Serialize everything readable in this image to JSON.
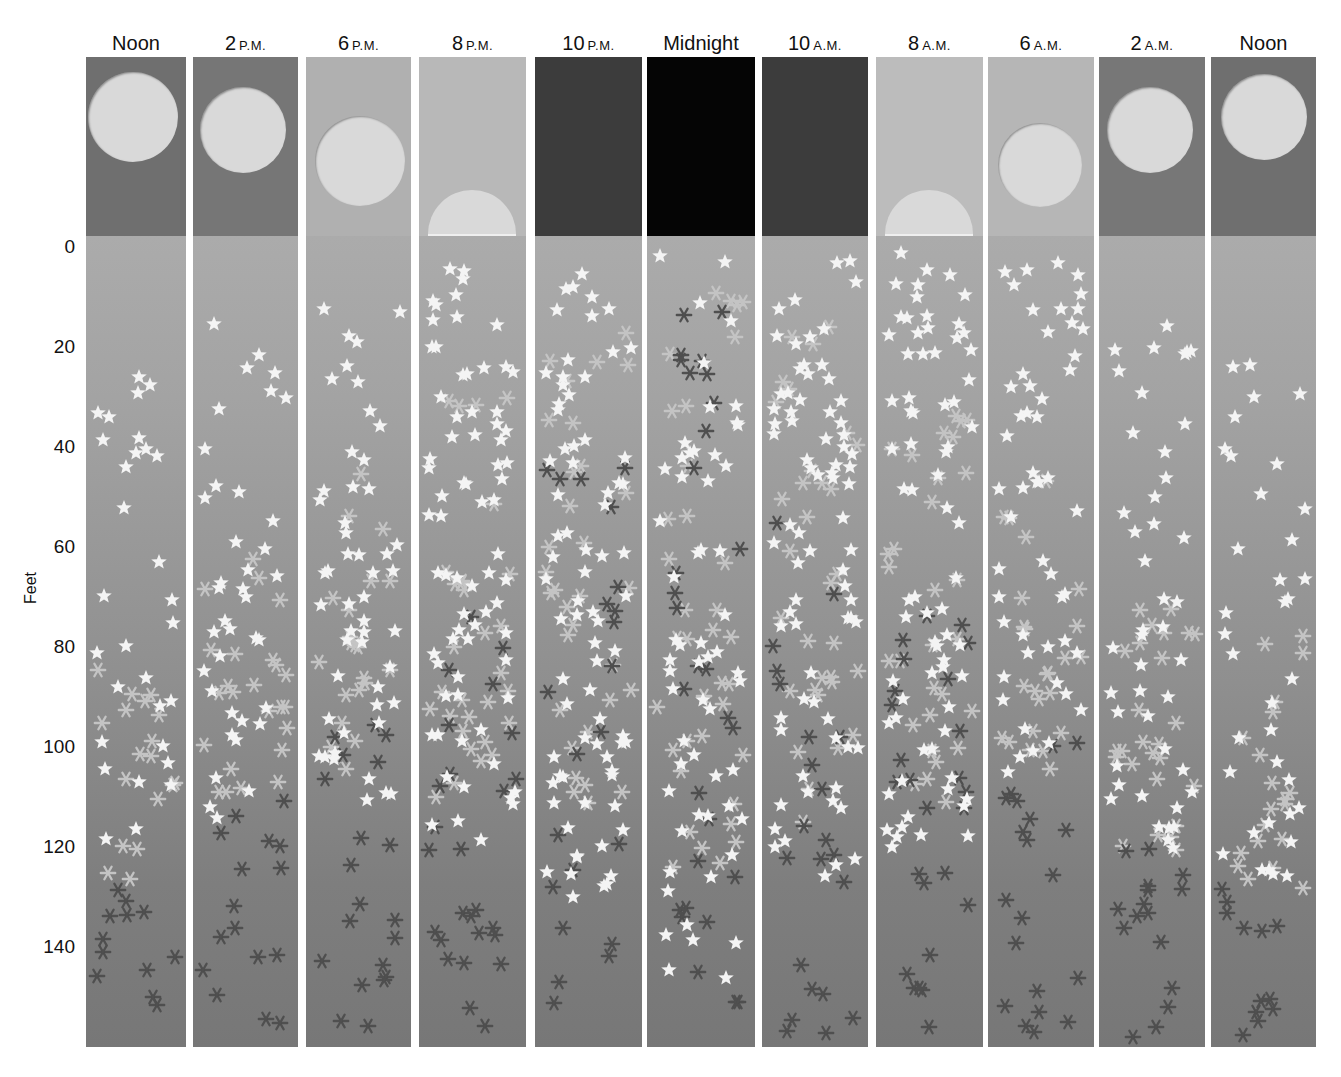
{
  "figure": {
    "axis": {
      "title": "Feet",
      "ticks": [
        "0",
        "20",
        "40",
        "60",
        "80",
        "100",
        "120",
        "140"
      ]
    },
    "legend_markers": {
      "star": "white-star",
      "light_asterisk": "light-asterisk",
      "dark_asterisk": "dark-asterisk"
    },
    "colors": {
      "star": "#f4f4f4",
      "light_asterisk": "#c4c4c4",
      "dark_asterisk": "#4f4f4f",
      "sun": "#d9d9d9"
    },
    "columns": [
      {
        "id": "noon-1",
        "num": "Noon",
        "suffix": "",
        "sky_color": "#6f6f6f",
        "sun": {
          "shape": "circle",
          "cx": 47,
          "cy": 60,
          "r": 45
        },
        "x": 86,
        "w": 100,
        "stars": {
          "from": 22,
          "to": 120,
          "count": 30
        },
        "light": {
          "from": 72,
          "to": 128,
          "count": 18
        },
        "dark": {
          "from": 128,
          "to": 158,
          "count": 12
        }
      },
      {
        "id": "2pm",
        "num": "2",
        "suffix": "P.M.",
        "sky_color": "#767676",
        "sun": {
          "shape": "circle",
          "cx": 50,
          "cy": 73,
          "r": 43
        },
        "x": 193,
        "w": 105,
        "stars": {
          "from": 15,
          "to": 118,
          "count": 38
        },
        "light": {
          "from": 55,
          "to": 112,
          "count": 24
        },
        "dark": {
          "from": 108,
          "to": 158,
          "count": 16
        }
      },
      {
        "id": "6pm",
        "num": "6",
        "suffix": "P.M.",
        "sky_color": "#b0b0b0",
        "sun": {
          "shape": "circle",
          "cx": 54,
          "cy": 104,
          "r": 45
        },
        "x": 306,
        "w": 105,
        "stars": {
          "from": 4,
          "to": 112,
          "count": 50
        },
        "light": {
          "from": 45,
          "to": 105,
          "count": 22
        },
        "dark": {
          "from": 95,
          "to": 158,
          "count": 20
        }
      },
      {
        "id": "8pm",
        "num": "8",
        "suffix": "P.M.",
        "sky_color": "#b8b8b8",
        "sun": {
          "shape": "half",
          "cx": 53,
          "cy": 177,
          "r": 44
        },
        "x": 419,
        "w": 107,
        "stars": {
          "from": 0,
          "to": 120,
          "count": 72
        },
        "light": {
          "from": 30,
          "to": 112,
          "count": 30
        },
        "dark": {
          "from": 68,
          "to": 158,
          "count": 26
        }
      },
      {
        "id": "10pm",
        "num": "10",
        "suffix": "P.M.",
        "sky_color": "#3c3c3c",
        "sun": null,
        "x": 535,
        "w": 107,
        "stars": {
          "from": 0,
          "to": 130,
          "count": 75
        },
        "light": {
          "from": 15,
          "to": 115,
          "count": 32
        },
        "dark": {
          "from": 42,
          "to": 158,
          "count": 22
        }
      },
      {
        "id": "midnight",
        "num": "Midnight",
        "suffix": "",
        "sky_color": "#050505",
        "sun": null,
        "x": 647,
        "w": 108,
        "stars": {
          "from": 0,
          "to": 148,
          "count": 58
        },
        "light": {
          "from": 0,
          "to": 125,
          "count": 36
        },
        "dark": {
          "from": 8,
          "to": 158,
          "count": 30
        }
      },
      {
        "id": "10am",
        "num": "10",
        "suffix": "A.M.",
        "sky_color": "#3c3c3c",
        "sun": null,
        "x": 762,
        "w": 106,
        "stars": {
          "from": 0,
          "to": 128,
          "count": 75
        },
        "light": {
          "from": 15,
          "to": 115,
          "count": 32
        },
        "dark": {
          "from": 50,
          "to": 158,
          "count": 22
        }
      },
      {
        "id": "8am",
        "num": "8",
        "suffix": "A.M.",
        "sky_color": "#bcbcbc",
        "sun": {
          "shape": "half",
          "cx": 53,
          "cy": 177,
          "r": 44
        },
        "x": 876,
        "w": 107,
        "stars": {
          "from": 0,
          "to": 120,
          "count": 72
        },
        "light": {
          "from": 30,
          "to": 112,
          "count": 30
        },
        "dark": {
          "from": 70,
          "to": 158,
          "count": 26
        }
      },
      {
        "id": "6am",
        "num": "6",
        "suffix": "A.M.",
        "sky_color": "#b6b6b6",
        "sun": {
          "shape": "circle",
          "cx": 52,
          "cy": 108,
          "r": 42
        },
        "x": 988,
        "w": 106,
        "stars": {
          "from": 2,
          "to": 112,
          "count": 52
        },
        "light": {
          "from": 45,
          "to": 105,
          "count": 24
        },
        "dark": {
          "from": 95,
          "to": 158,
          "count": 20
        }
      },
      {
        "id": "2am",
        "num": "2",
        "suffix": "A.M.",
        "sky_color": "#777777",
        "sun": {
          "shape": "circle",
          "cx": 51,
          "cy": 73,
          "r": 43
        },
        "x": 1099,
        "w": 106,
        "stars": {
          "from": 14,
          "to": 124,
          "count": 44
        },
        "light": {
          "from": 60,
          "to": 122,
          "count": 26
        },
        "dark": {
          "from": 118,
          "to": 158,
          "count": 16
        }
      },
      {
        "id": "noon-2",
        "num": "Noon",
        "suffix": "",
        "sky_color": "#6f6f6f",
        "sun": {
          "shape": "circle",
          "cx": 53,
          "cy": 60,
          "r": 43
        },
        "x": 1211,
        "w": 105,
        "stars": {
          "from": 22,
          "to": 128,
          "count": 36
        },
        "light": {
          "from": 76,
          "to": 128,
          "count": 20
        },
        "dark": {
          "from": 128,
          "to": 158,
          "count": 12
        }
      }
    ]
  }
}
